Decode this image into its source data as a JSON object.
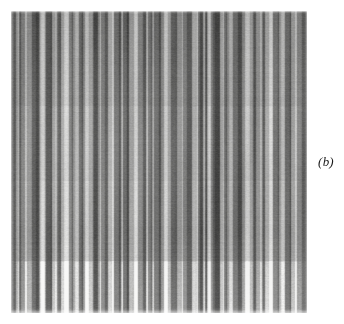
{
  "figure": {
    "kind": "grayscale-striation-plate",
    "panel_label": "(b)",
    "background_color": "#ffffff",
    "plate": {
      "x": 11,
      "y": 11,
      "width": 296,
      "height": 302,
      "description": "Dense vertical striation / fringe pattern, irregular widths and gray levels",
      "dominant_gray": "#8a8a8a",
      "darkest_gray": "#1d1d1d",
      "lightest_gray": "#f2f2f0",
      "orientation": "vertical",
      "stripe_count": 196,
      "stripe_widths_px": [
        1,
        2,
        3,
        4,
        5
      ],
      "row_bands": [
        {
          "name": "top",
          "y0": 0,
          "y1": 95,
          "mean_gray": 128,
          "contrast": 0.72
        },
        {
          "name": "upper-middle",
          "y0": 95,
          "y1": 170,
          "mean_gray": 132,
          "contrast": 0.78
        },
        {
          "name": "lower-middle",
          "y0": 170,
          "y1": 250,
          "mean_gray": 136,
          "contrast": 0.82
        },
        {
          "name": "bottom",
          "y0": 250,
          "y1": 302,
          "mean_gray": 150,
          "contrast": 0.95
        }
      ]
    }
  },
  "chart_data": {
    "type": "heatmap",
    "title": "(b)",
    "xlabel": "",
    "ylabel": "",
    "orientation": "vertical-stripes",
    "colormap": "grayscale",
    "vmin": 0,
    "vmax": 255,
    "grid": false,
    "legend": "none",
    "note": "Intensity profile is constant along y; each value is the gray level of one vertical stripe read left-to-right across the plate.",
    "stripe_values": [
      92,
      70,
      150,
      188,
      96,
      58,
      120,
      205,
      142,
      74,
      46,
      110,
      176,
      214,
      130,
      66,
      38,
      158,
      196,
      104,
      82,
      54,
      168,
      222,
      118,
      62,
      140,
      184,
      90,
      44,
      126,
      206,
      160,
      78,
      50,
      134,
      198,
      112,
      68,
      172,
      228,
      100,
      56,
      146,
      190,
      86,
      42,
      152,
      216,
      124,
      72,
      48,
      164,
      202,
      108,
      64,
      138,
      180,
      94,
      52,
      128,
      210,
      156,
      80,
      60,
      144,
      194,
      116,
      70,
      174,
      224,
      102,
      54,
      148,
      186,
      88,
      40,
      154,
      212,
      122,
      76,
      46,
      162,
      200,
      106,
      66,
      136,
      182,
      98,
      56,
      132,
      208,
      158,
      84,
      62,
      142,
      196,
      114,
      74,
      170,
      226,
      108,
      58,
      150,
      192,
      92,
      44,
      156,
      218,
      126,
      78,
      50,
      166,
      204,
      110,
      68,
      140,
      178,
      96,
      54,
      130,
      214,
      160,
      86,
      64,
      146,
      200,
      118,
      72,
      176,
      230,
      104,
      60,
      152,
      188,
      90,
      42,
      160,
      220,
      128,
      80,
      52,
      168,
      206,
      112,
      70,
      134,
      186,
      100,
      58,
      136,
      212,
      164,
      88,
      66,
      148,
      198,
      120,
      76,
      172,
      232,
      106,
      62,
      154,
      194,
      94,
      48,
      158,
      216,
      124,
      82,
      56,
      170,
      208,
      114,
      72,
      142,
      184,
      102,
      60,
      138,
      218,
      166,
      90,
      68,
      150,
      202,
      122,
      78,
      178,
      234,
      110,
      64,
      146,
      190,
      98,
      50,
      162,
      222,
      130
    ]
  }
}
